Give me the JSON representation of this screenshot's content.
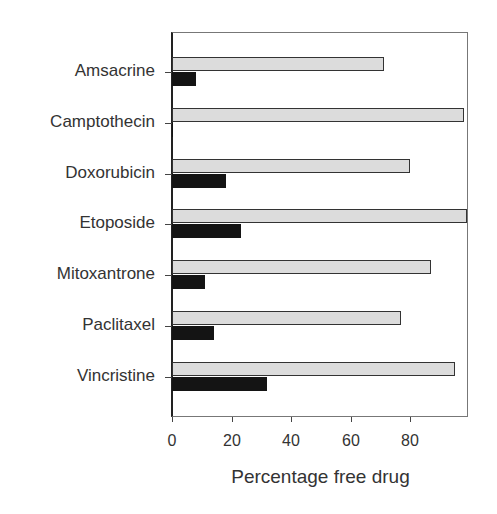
{
  "chart_data": {
    "type": "bar",
    "orientation": "horizontal",
    "title": "",
    "xlabel": "Percentage free drug",
    "ylabel": "",
    "xlim": [
      0,
      99
    ],
    "x_ticks": [
      "0",
      "20",
      "40",
      "60",
      "80"
    ],
    "grid": false,
    "legend": null,
    "categories": [
      "Amsacrine",
      "Camptothecin",
      "Doxorubicin",
      "Etoposide",
      "Mitoxantrone",
      "Paclitaxel",
      "Vincristine"
    ],
    "series": [
      {
        "name": "light-gray bars (upper)",
        "color": "#dcdcdc",
        "values": [
          71,
          98,
          80,
          99,
          87,
          77,
          95
        ]
      },
      {
        "name": "black bars (lower)",
        "color": "#141414",
        "values": [
          8,
          0.5,
          18,
          23,
          11,
          14,
          32
        ]
      }
    ]
  }
}
